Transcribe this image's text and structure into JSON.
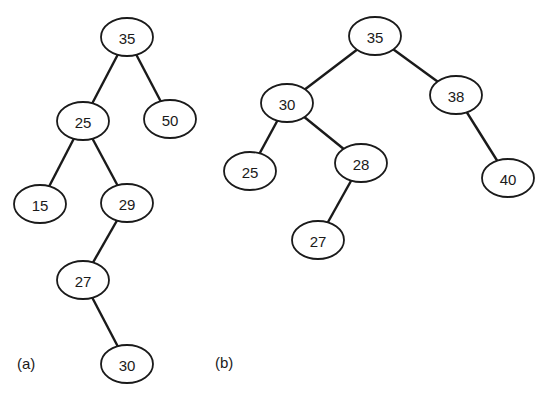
{
  "figure": {
    "colors": {
      "stroke": "#1a1a1a",
      "fill": "#ffffff",
      "background": "#ffffff"
    },
    "panels": [
      {
        "label": "(a)",
        "nodes": [
          {
            "id": "a35",
            "value": "35",
            "x": 127,
            "y": 37
          },
          {
            "id": "a25",
            "value": "25",
            "x": 83,
            "y": 121
          },
          {
            "id": "a50",
            "value": "50",
            "x": 170,
            "y": 119
          },
          {
            "id": "a15",
            "value": "15",
            "x": 40,
            "y": 204
          },
          {
            "id": "a29",
            "value": "29",
            "x": 127,
            "y": 203
          },
          {
            "id": "a27",
            "value": "27",
            "x": 83,
            "y": 280
          },
          {
            "id": "a30",
            "value": "30",
            "x": 127,
            "y": 364
          }
        ],
        "edges": [
          [
            "a35",
            "a25"
          ],
          [
            "a35",
            "a50"
          ],
          [
            "a25",
            "a15"
          ],
          [
            "a25",
            "a29"
          ],
          [
            "a29",
            "a27"
          ],
          [
            "a27",
            "a30"
          ]
        ]
      },
      {
        "label": "(b)",
        "nodes": [
          {
            "id": "b35",
            "value": "35",
            "x": 375,
            "y": 36
          },
          {
            "id": "b30",
            "value": "30",
            "x": 287,
            "y": 103
          },
          {
            "id": "b38",
            "value": "38",
            "x": 456,
            "y": 95
          },
          {
            "id": "b25",
            "value": "25",
            "x": 250,
            "y": 171
          },
          {
            "id": "b28",
            "value": "28",
            "x": 361,
            "y": 163
          },
          {
            "id": "b40",
            "value": "40",
            "x": 508,
            "y": 178
          },
          {
            "id": "b27",
            "value": "27",
            "x": 318,
            "y": 240
          }
        ],
        "edges": [
          [
            "b35",
            "b30"
          ],
          [
            "b35",
            "b38"
          ],
          [
            "b30",
            "b25"
          ],
          [
            "b30",
            "b28"
          ],
          [
            "b28",
            "b27"
          ],
          [
            "b38",
            "b40"
          ]
        ]
      }
    ]
  }
}
